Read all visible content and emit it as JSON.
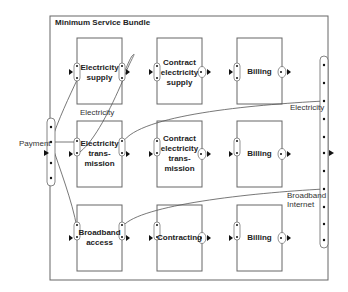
{
  "diagram": {
    "title": "Minimum Service Bundle",
    "colors": {
      "stroke": "#555555",
      "text": "#222222",
      "background": "#ffffff"
    },
    "rows": [
      {
        "boxes": [
          {
            "label": "Electricity\nsupply",
            "label_lines": [
              "Electricity",
              "supply"
            ]
          },
          {
            "label": "Contract electricity supply",
            "label_lines": [
              "Contract",
              "electricity",
              "supply"
            ]
          },
          {
            "label": "Billing",
            "label_lines": [
              "Billing"
            ]
          }
        ]
      },
      {
        "boxes": [
          {
            "label": "Electricity trans-mission",
            "label_lines": [
              "Electricity",
              "trans-",
              "mission"
            ]
          },
          {
            "label": "Contract electricity trans-mission",
            "label_lines": [
              "Contract",
              "electricity",
              "trans-",
              "mission"
            ]
          },
          {
            "label": "Billing",
            "label_lines": [
              "Billing"
            ]
          }
        ]
      },
      {
        "boxes": [
          {
            "label": "Broadband access",
            "label_lines": [
              "Broadband",
              "access"
            ]
          },
          {
            "label": "Contracting",
            "label_lines": [
              "Contracting"
            ]
          },
          {
            "label": "Billing",
            "label_lines": [
              "Billing"
            ]
          }
        ]
      }
    ],
    "edge_labels": {
      "electricity_inner": "Electricity",
      "electricity_outer": "Electricity",
      "payment": "Payment",
      "broadband_line1": "Broadband",
      "broadband_line2": "Internet"
    }
  }
}
